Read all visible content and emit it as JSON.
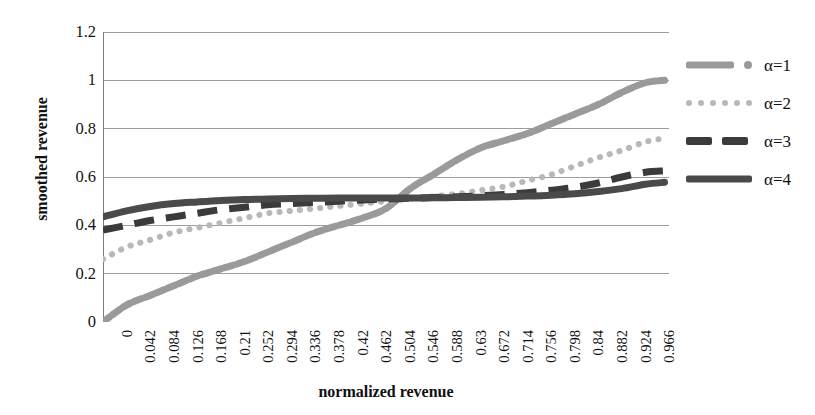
{
  "chart_data": {
    "type": "line",
    "title": "",
    "xlabel": "normalized revenue",
    "ylabel": "smoothed revenue",
    "xlim": [
      0,
      1.008
    ],
    "ylim": [
      0,
      1.2
    ],
    "grid": true,
    "legend_position": "right",
    "x_tick_labels": [
      "0",
      "0.042",
      "0.084",
      "0.126",
      "0.168",
      "0.21",
      "0.252",
      "0.294",
      "0.336",
      "0.378",
      "0.42",
      "0.462",
      "0.504",
      "0.546",
      "0.588",
      "0.63",
      "0.672",
      "0.714",
      "0.756",
      "0.798",
      "0.84",
      "0.882",
      "0.924",
      "0.966"
    ],
    "y_tick_labels": [
      "0",
      "0.2",
      "0.4",
      "0.6",
      "0.8",
      "1",
      "1.2"
    ],
    "y_tick_values": [
      0,
      0.2,
      0.4,
      0.6,
      0.8,
      1.0,
      1.2
    ],
    "x": [
      0,
      0.042,
      0.084,
      0.126,
      0.168,
      0.21,
      0.252,
      0.294,
      0.336,
      0.378,
      0.42,
      0.462,
      0.504,
      0.546,
      0.588,
      0.63,
      0.672,
      0.714,
      0.756,
      0.798,
      0.84,
      0.882,
      0.924,
      0.966,
      1.0
    ],
    "series": [
      {
        "name": "α=1",
        "style": "thick-dotted",
        "color": "#9a9a9a",
        "values": [
          0.0,
          0.07,
          0.11,
          0.15,
          0.19,
          0.22,
          0.25,
          0.29,
          0.33,
          0.37,
          0.4,
          0.43,
          0.47,
          0.55,
          0.61,
          0.67,
          0.72,
          0.75,
          0.78,
          0.82,
          0.86,
          0.9,
          0.95,
          0.99,
          1.0
        ]
      },
      {
        "name": "α=2",
        "style": "dotted",
        "color": "#b8b8b8",
        "values": [
          0.26,
          0.31,
          0.34,
          0.37,
          0.39,
          0.41,
          0.43,
          0.45,
          0.46,
          0.47,
          0.48,
          0.49,
          0.5,
          0.51,
          0.52,
          0.53,
          0.545,
          0.56,
          0.585,
          0.61,
          0.645,
          0.68,
          0.71,
          0.745,
          0.76
        ]
      },
      {
        "name": "α=3",
        "style": "dashed",
        "color": "#3b3b3b",
        "values": [
          0.38,
          0.4,
          0.42,
          0.435,
          0.45,
          0.465,
          0.475,
          0.485,
          0.49,
          0.495,
          0.5,
          0.505,
          0.508,
          0.512,
          0.515,
          0.518,
          0.522,
          0.528,
          0.535,
          0.545,
          0.557,
          0.575,
          0.6,
          0.62,
          0.625
        ]
      },
      {
        "name": "α=4",
        "style": "solid",
        "color": "#4a4a4a",
        "values": [
          0.435,
          0.46,
          0.478,
          0.49,
          0.497,
          0.503,
          0.507,
          0.509,
          0.511,
          0.512,
          0.513,
          0.513,
          0.513,
          0.513,
          0.514,
          0.515,
          0.516,
          0.518,
          0.521,
          0.525,
          0.531,
          0.54,
          0.552,
          0.57,
          0.578
        ]
      }
    ]
  },
  "legend": {
    "items": [
      {
        "label": "α=1",
        "swatch": "thick-dotted-swatch"
      },
      {
        "label": "α=2",
        "swatch": "dotted-swatch"
      },
      {
        "label": "α=3",
        "swatch": "dashed-swatch"
      },
      {
        "label": "α=4",
        "swatch": "solid-swatch"
      }
    ]
  },
  "colors": {
    "axis": "#7d7d7d",
    "grid": "#9d9d9d",
    "text": "#111111",
    "alpha1": "#9a9a9a",
    "alpha2": "#b8b8b8",
    "alpha3": "#3b3b3b",
    "alpha4": "#4a4a4a"
  }
}
